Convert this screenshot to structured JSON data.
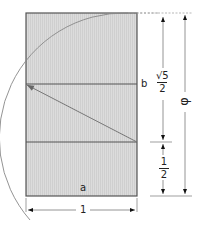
{
  "diagram": {
    "labels": {
      "a": "a",
      "b": "b",
      "width": "1",
      "half_num": "1",
      "half_den": "2",
      "sqrt5_num": "√5",
      "sqrt5_den": "2",
      "phi": "φ"
    },
    "colors": {
      "fill": "#d9d9d9",
      "stroke": "#555555",
      "arc": "#777777",
      "dim": "#222222"
    }
  }
}
